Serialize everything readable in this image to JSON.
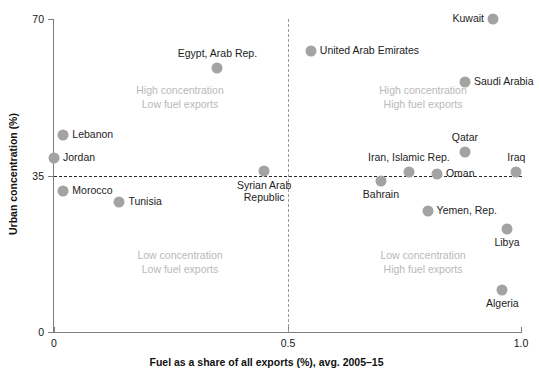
{
  "chart_data": {
    "type": "scatter",
    "title": "",
    "xlabel": "Fuel as a share of all exports (%), avg. 2005–15",
    "ylabel": "Urban concentration (%)",
    "xlim": [
      0,
      1.0
    ],
    "ylim": [
      0,
      70
    ],
    "xticks": [
      "0",
      "0.5",
      "1.0"
    ],
    "xtick_values": [
      0,
      0.5,
      1.0
    ],
    "yticks": [
      "0",
      "35",
      "70"
    ],
    "ytick_values": [
      0,
      35,
      70
    ],
    "grid": false,
    "legend": "none",
    "reference_lines": {
      "horizontal": {
        "value": 35,
        "style": "dashed",
        "color": "#2b2b2b"
      },
      "vertical": {
        "value": 0.5,
        "style": "dashed",
        "color": "#9a9a9a"
      }
    },
    "marker_color": "#a3a3a3",
    "points": [
      {
        "name": "Kuwait",
        "x": 0.94,
        "y": 70.0,
        "label_pos": "left"
      },
      {
        "name": "Egypt, Arab Rep.",
        "x": 0.35,
        "y": 59.0,
        "label_pos": "above"
      },
      {
        "name": "United Arab Emirates",
        "x": 0.55,
        "y": 62.8,
        "label_pos": "right"
      },
      {
        "name": "Saudi Arabia",
        "x": 0.88,
        "y": 55.9,
        "label_pos": "right"
      },
      {
        "name": "Lebanon",
        "x": 0.02,
        "y": 44.1,
        "label_pos": "right"
      },
      {
        "name": "Jordan",
        "x": 0.0,
        "y": 38.9,
        "label_pos": "right"
      },
      {
        "name": "Qatar",
        "x": 0.88,
        "y": 40.3,
        "label_pos": "above"
      },
      {
        "name": "Iran, Islamic Rep.",
        "x": 0.76,
        "y": 35.8,
        "label_pos": "above"
      },
      {
        "name": "Oman",
        "x": 0.82,
        "y": 35.4,
        "label_pos": "right"
      },
      {
        "name": "Iraq",
        "x": 0.99,
        "y": 35.8,
        "label_pos": "above"
      },
      {
        "name": "Syrian Arab Republic",
        "x": 0.45,
        "y": 36.0,
        "label_pos": "below"
      },
      {
        "name": "Morocco",
        "x": 0.02,
        "y": 31.5,
        "label_pos": "right"
      },
      {
        "name": "Bahrain",
        "x": 0.7,
        "y": 33.8,
        "label_pos": "below"
      },
      {
        "name": "Tunisia",
        "x": 0.14,
        "y": 29.1,
        "label_pos": "right"
      },
      {
        "name": "Yemen, Rep.",
        "x": 0.8,
        "y": 27.1,
        "label_pos": "right"
      },
      {
        "name": "Libya",
        "x": 0.97,
        "y": 23.0,
        "label_pos": "below"
      },
      {
        "name": "Algeria",
        "x": 0.96,
        "y": 9.4,
        "label_pos": "below"
      }
    ],
    "annotations": [
      {
        "line1": "High concentration",
        "line2": "Low fuel exports",
        "x": 0.27,
        "y": 55.5
      },
      {
        "line1": "High concentration",
        "line2": "High fuel exports",
        "x": 0.79,
        "y": 55.5
      },
      {
        "line1": "Low concentration",
        "line2": "Low fuel exports",
        "x": 0.27,
        "y": 18.5
      },
      {
        "line1": "Low concentration",
        "line2": "High fuel exports",
        "x": 0.79,
        "y": 18.5
      }
    ]
  }
}
